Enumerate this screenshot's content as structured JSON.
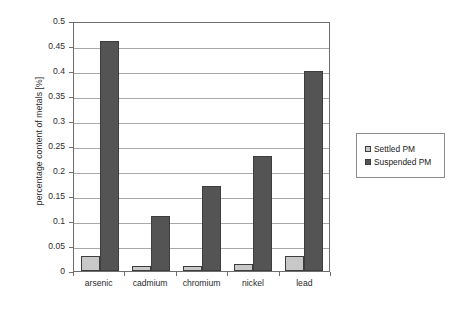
{
  "chart_data": {
    "type": "bar",
    "title": "",
    "xlabel": "",
    "ylabel": "percentage content of metals [%]",
    "categories": [
      "arsenic",
      "cadmium",
      "chromium",
      "nickel",
      "lead"
    ],
    "series": [
      {
        "name": "Settled PM",
        "color": "#c8c8c8",
        "values": [
          0.03,
          0.01,
          0.01,
          0.015,
          0.03
        ]
      },
      {
        "name": "Suspended PM",
        "color": "#545454",
        "values": [
          0.46,
          0.11,
          0.17,
          0.23,
          0.4
        ]
      }
    ],
    "ylim": [
      0,
      0.5
    ],
    "ytick_step": 0.05,
    "ytick_labels": [
      "0",
      "0.05",
      "0.1",
      "0.15",
      "0.2",
      "0.25",
      "0.3",
      "0.35",
      "0.4",
      "0.45",
      "0.5"
    ],
    "grid": true,
    "grid_axis": "y",
    "legend_position": "right",
    "bar_border_color": "#3d3d3d",
    "axis_color": "#6e6e6e",
    "gridline_color": "#a9a9a9",
    "background": "#ffffff"
  },
  "legend": {
    "entries": [
      {
        "label": "Settled PM"
      },
      {
        "label": "Suspended PM"
      }
    ]
  }
}
